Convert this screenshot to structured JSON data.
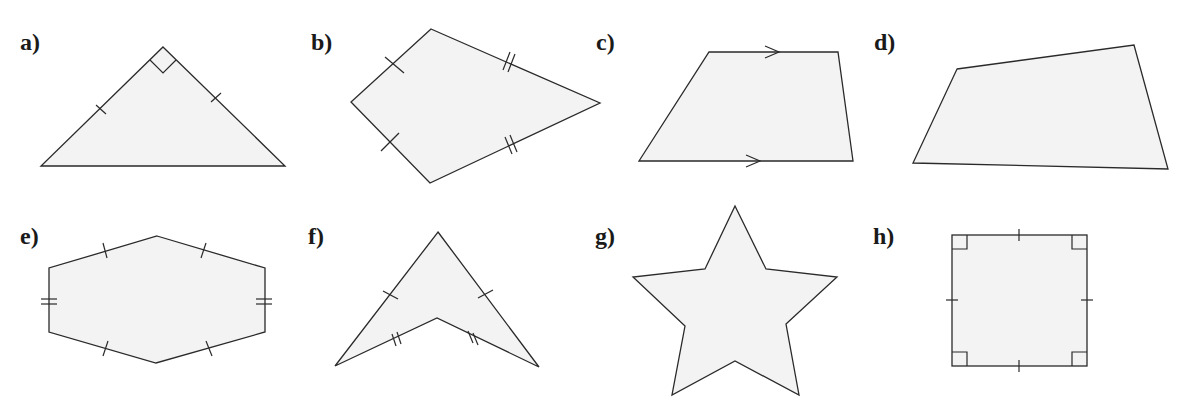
{
  "figure": {
    "background": "#ffffff",
    "shape_fill": "#f3f3f3",
    "stroke_color": "#2a2a2a",
    "panels": [
      {
        "label": "a)",
        "shape": "right isosceles triangle",
        "marks": "right angle at apex, single tick on both legs"
      },
      {
        "label": "b)",
        "shape": "kite",
        "marks": "single ticks on left sides, double ticks on right sides"
      },
      {
        "label": "c)",
        "shape": "trapezium",
        "marks": "parallel arrows on top and bottom"
      },
      {
        "label": "d)",
        "shape": "irregular quadrilateral",
        "marks": "none"
      },
      {
        "label": "e)",
        "shape": "hexagon",
        "marks": "single ticks on slanted sides, double ticks on vertical sides"
      },
      {
        "label": "f)",
        "shape": "arrowhead (dart)",
        "marks": "single ticks on outer sides, double ticks on inner sides"
      },
      {
        "label": "g)",
        "shape": "five-pointed star",
        "marks": "none"
      },
      {
        "label": "h)",
        "shape": "square",
        "marks": "right angles at all corners, single tick on each side"
      }
    ]
  }
}
